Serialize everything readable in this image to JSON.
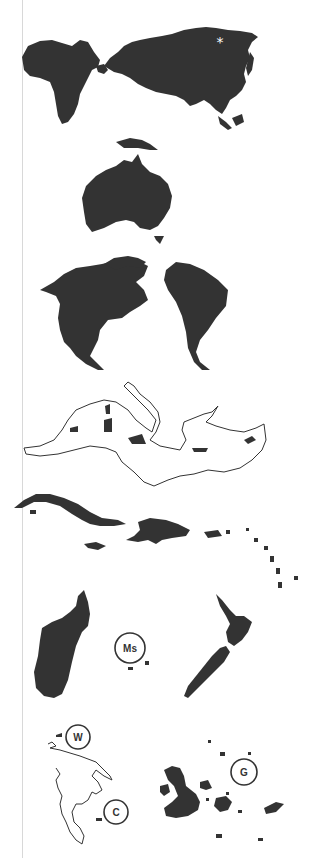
{
  "figure": {
    "type": "map-panel-series",
    "colors": {
      "land": "#333333",
      "background": "#ffffff",
      "gutter": "#d8d8d8"
    },
    "panels": [
      {
        "id": "eurasia-africa",
        "region": "Africa and Eurasia",
        "marker": "*"
      },
      {
        "id": "australia",
        "region": "Australia and New Guinea"
      },
      {
        "id": "americas",
        "region": "North and South America"
      },
      {
        "id": "mediterranean",
        "region": "Mediterranean Sea (outline) with islands"
      },
      {
        "id": "caribbean",
        "region": "Caribbean islands"
      },
      {
        "id": "madagascar-nz",
        "region": "Madagascar, Mascarenes, New Zealand",
        "label": "Ms"
      },
      {
        "id": "wallacea-galapagos",
        "region": "Outline islands and Galápagos",
        "labels": [
          "W",
          "C",
          "G"
        ]
      }
    ],
    "labels": {
      "asterisk": "*",
      "mascarenes": "Ms",
      "w": "W",
      "c": "C",
      "galapagos": "G"
    }
  }
}
